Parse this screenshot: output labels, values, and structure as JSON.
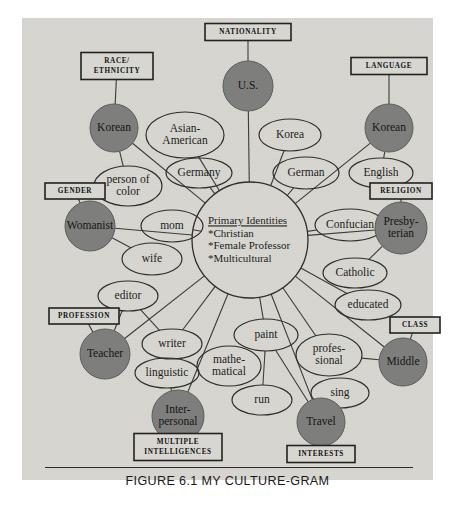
{
  "figure": {
    "caption": "FIGURE 6.1 MY CULTURE-GRAM",
    "panel_color": "#d7d6d1",
    "circle_color": "#7e7e7c",
    "ink_color": "#1d1d1b"
  },
  "center": {
    "title": "Primary Identities",
    "items": [
      "*Christian",
      "*Female Professor",
      "*Multicultural"
    ]
  },
  "categories": [
    {
      "id": "nationality",
      "label": "NATIONALITY",
      "lines": [
        "NATIONALITY"
      ],
      "x": 226,
      "y": 14,
      "w": 86,
      "h": 17
    },
    {
      "id": "race-ethnicity",
      "label": "RACE/ ETHNICITY",
      "lines": [
        "RACE/",
        "ETHNICITY"
      ],
      "x": 95,
      "y": 48,
      "w": 72,
      "h": 27
    },
    {
      "id": "language",
      "label": "LANGUAGE",
      "lines": [
        "LANGUAGE"
      ],
      "x": 367,
      "y": 48,
      "w": 76,
      "h": 17
    },
    {
      "id": "gender",
      "label": "GENDER",
      "lines": [
        "GENDER"
      ],
      "x": 53,
      "y": 173,
      "w": 60,
      "h": 16
    },
    {
      "id": "religion",
      "label": "RELIGION",
      "lines": [
        "RELIGION"
      ],
      "x": 379,
      "y": 173,
      "w": 62,
      "h": 16
    },
    {
      "id": "profession",
      "label": "PROFESSION",
      "lines": [
        "PROFESSION"
      ],
      "x": 62,
      "y": 298,
      "w": 70,
      "h": 16
    },
    {
      "id": "class",
      "label": "CLASS",
      "lines": [
        "CLASS"
      ],
      "x": 393,
      "y": 307,
      "w": 50,
      "h": 16
    },
    {
      "id": "multiple-intelligences",
      "label": "MULTIPLE INTELLIGENCES",
      "lines": [
        "MULTIPLE",
        "INTELLIGENCES"
      ],
      "x": 156,
      "y": 429,
      "w": 88,
      "h": 27
    },
    {
      "id": "interests",
      "label": "INTERESTS",
      "lines": [
        "INTERESTS"
      ],
      "x": 299,
      "y": 436,
      "w": 68,
      "h": 17
    }
  ],
  "primary_nodes": [
    {
      "id": "us",
      "label": "U.S.",
      "lines": [
        "U.S."
      ],
      "category": "nationality",
      "x": 226,
      "y": 68,
      "r": 25
    },
    {
      "id": "korean-race",
      "label": "Korean",
      "lines": [
        "Korean"
      ],
      "category": "race-ethnicity",
      "x": 92,
      "y": 110,
      "r": 24
    },
    {
      "id": "korean-language",
      "label": "Korean",
      "lines": [
        "Korean"
      ],
      "category": "language",
      "x": 367,
      "y": 110,
      "r": 24
    },
    {
      "id": "womanist",
      "label": "Womanist",
      "lines": [
        "Womanist"
      ],
      "category": "gender",
      "x": 68,
      "y": 208,
      "r": 25
    },
    {
      "id": "presbyterian",
      "label": "Presbyterian",
      "lines": [
        "Presby-",
        "terian"
      ],
      "category": "religion",
      "x": 379,
      "y": 210,
      "r": 26
    },
    {
      "id": "teacher",
      "label": "Teacher",
      "lines": [
        "Teacher"
      ],
      "category": "profession",
      "x": 83,
      "y": 336,
      "r": 25
    },
    {
      "id": "middle",
      "label": "Middle",
      "lines": [
        "Middle"
      ],
      "category": "class",
      "x": 381,
      "y": 344,
      "r": 24
    },
    {
      "id": "interpersonal",
      "label": "Interpersonal",
      "lines": [
        "Inter-",
        "personal"
      ],
      "category": "multiple-intelligences",
      "x": 156,
      "y": 398,
      "r": 26
    },
    {
      "id": "travel",
      "label": "Travel",
      "lines": [
        "Travel"
      ],
      "category": "interests",
      "x": 299,
      "y": 404,
      "r": 24
    }
  ],
  "secondary_nodes": [
    {
      "id": "asian-american",
      "label": "Asian-American",
      "lines": [
        "Asian-",
        "American"
      ],
      "x": 163,
      "y": 117,
      "rx": 39,
      "ry": 23
    },
    {
      "id": "germany",
      "label": "Germany",
      "lines": [
        "Germany"
      ],
      "x": 177,
      "y": 155,
      "rx": 33,
      "ry": 15
    },
    {
      "id": "korea",
      "label": "Korea",
      "lines": [
        "Korea"
      ],
      "x": 268,
      "y": 117,
      "rx": 31,
      "ry": 16
    },
    {
      "id": "german",
      "label": "German",
      "lines": [
        "German"
      ],
      "x": 284,
      "y": 155,
      "rx": 33,
      "ry": 16
    },
    {
      "id": "english",
      "label": "English",
      "lines": [
        "English"
      ],
      "x": 359,
      "y": 155,
      "rx": 32,
      "ry": 15
    },
    {
      "id": "person-of-color",
      "label": "person of color",
      "lines": [
        "person of",
        "color"
      ],
      "x": 106,
      "y": 168,
      "rx": 34,
      "ry": 20
    },
    {
      "id": "mom",
      "label": "mom",
      "lines": [
        "mom"
      ],
      "x": 150,
      "y": 208,
      "rx": 31,
      "ry": 16
    },
    {
      "id": "wife",
      "label": "wife",
      "lines": [
        "wife"
      ],
      "x": 130,
      "y": 241,
      "rx": 30,
      "ry": 16
    },
    {
      "id": "confucian",
      "label": "Confucian",
      "lines": [
        "Confucian"
      ],
      "x": 328,
      "y": 207,
      "rx": 35,
      "ry": 16
    },
    {
      "id": "catholic",
      "label": "Catholic",
      "lines": [
        "Catholic"
      ],
      "x": 333,
      "y": 255,
      "rx": 32,
      "ry": 15
    },
    {
      "id": "educated",
      "label": "educated",
      "lines": [
        "educated"
      ],
      "x": 346,
      "y": 287,
      "rx": 33,
      "ry": 15
    },
    {
      "id": "editor",
      "label": "editor",
      "lines": [
        "editor"
      ],
      "x": 106,
      "y": 278,
      "rx": 30,
      "ry": 15
    },
    {
      "id": "writer",
      "label": "writer",
      "lines": [
        "writer"
      ],
      "x": 150,
      "y": 326,
      "rx": 30,
      "ry": 15
    },
    {
      "id": "linguistic",
      "label": "linguistic",
      "lines": [
        "linguistic"
      ],
      "x": 145,
      "y": 355,
      "rx": 32,
      "ry": 15
    },
    {
      "id": "mathematical",
      "label": "mathematical",
      "lines": [
        "mathe-",
        "matical"
      ],
      "x": 207,
      "y": 348,
      "rx": 32,
      "ry": 20
    },
    {
      "id": "paint",
      "label": "paint",
      "lines": [
        "paint"
      ],
      "x": 244,
      "y": 317,
      "rx": 32,
      "ry": 16
    },
    {
      "id": "professional",
      "label": "professional",
      "lines": [
        "profes-",
        "sional"
      ],
      "x": 307,
      "y": 337,
      "rx": 33,
      "ry": 21
    },
    {
      "id": "run",
      "label": "run",
      "lines": [
        "run"
      ],
      "x": 240,
      "y": 382,
      "rx": 30,
      "ry": 15
    },
    {
      "id": "sing",
      "label": "sing",
      "lines": [
        "sing"
      ],
      "x": 318,
      "y": 375,
      "rx": 29,
      "ry": 15
    }
  ],
  "edges": [
    {
      "from": "nationality",
      "to": "us"
    },
    {
      "from": "race-ethnicity",
      "to": "korean-race"
    },
    {
      "from": "language",
      "to": "korean-language"
    },
    {
      "from": "gender",
      "to": "womanist"
    },
    {
      "from": "religion",
      "to": "presbyterian"
    },
    {
      "from": "profession",
      "to": "teacher"
    },
    {
      "from": "class",
      "to": "middle"
    },
    {
      "from": "multiple-intelligences",
      "to": "interpersonal"
    },
    {
      "from": "interests",
      "to": "travel"
    },
    {
      "from": "us",
      "to": "center"
    },
    {
      "from": "korean-race",
      "to": "center"
    },
    {
      "from": "korean-language",
      "to": "center"
    },
    {
      "from": "womanist",
      "to": "center"
    },
    {
      "from": "presbyterian",
      "to": "center"
    },
    {
      "from": "teacher",
      "to": "center"
    },
    {
      "from": "middle",
      "to": "center"
    },
    {
      "from": "interpersonal",
      "to": "center"
    },
    {
      "from": "travel",
      "to": "center"
    },
    {
      "from": "asian-american",
      "to": "center"
    },
    {
      "from": "germany",
      "to": "center"
    },
    {
      "from": "korea",
      "to": "center"
    },
    {
      "from": "german",
      "to": "center"
    },
    {
      "from": "english",
      "to": "korean-language"
    },
    {
      "from": "person-of-color",
      "to": "korean-race"
    },
    {
      "from": "mom",
      "to": "center"
    },
    {
      "from": "wife",
      "to": "womanist"
    },
    {
      "from": "confucian",
      "to": "center"
    },
    {
      "from": "catholic",
      "to": "presbyterian"
    },
    {
      "from": "educated",
      "to": "center"
    },
    {
      "from": "editor",
      "to": "writer"
    },
    {
      "from": "writer",
      "to": "center"
    },
    {
      "from": "linguistic",
      "to": "interpersonal"
    },
    {
      "from": "mathematical",
      "to": "linguistic"
    },
    {
      "from": "paint",
      "to": "center"
    },
    {
      "from": "professional",
      "to": "middle"
    },
    {
      "from": "run",
      "to": "paint"
    },
    {
      "from": "sing",
      "to": "travel"
    },
    {
      "from": "teacher",
      "to": "editor"
    },
    {
      "from": "paint",
      "to": "travel"
    },
    {
      "from": "professional",
      "to": "center"
    }
  ]
}
